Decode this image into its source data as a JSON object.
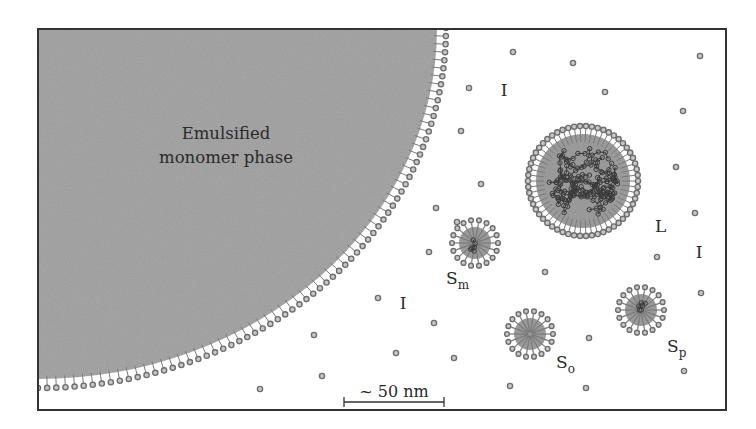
{
  "figure": {
    "width": 756,
    "height": 429,
    "frame": {
      "x": 38,
      "y": 29,
      "w": 688,
      "h": 381,
      "stroke": "#333333"
    },
    "colors": {
      "phase_fill": "#a9a9a9",
      "particle_fill": "#a0a0a0",
      "head_stroke": "#6e6e6e",
      "head_fill": "#c8c8c8",
      "tail_stroke": "#7a7a7a",
      "chain_stroke": "#3a3a3a",
      "text": "#2a2a2a"
    }
  },
  "monomer_phase": {
    "label_line1": "Emulsified",
    "label_line2": "monomer phase",
    "center": [
      38,
      28
    ],
    "rx": 408,
    "ry": 360
  },
  "particles": [
    {
      "id": "L",
      "label": "L",
      "subscript": "",
      "description": "Latex particle",
      "cx": 583,
      "cy": 181,
      "r": 47,
      "heads": 58,
      "has_chains": true,
      "chain_density": "high",
      "label_pos": [
        655,
        232
      ]
    },
    {
      "id": "Sm",
      "label": "S",
      "subscript": "m",
      "description": "Monomer-swollen micelle",
      "cx": 475,
      "cy": 243,
      "r": 16,
      "heads": 18,
      "has_chains": true,
      "chain_density": "low",
      "label_pos": [
        446,
        284
      ]
    },
    {
      "id": "So",
      "label": "S",
      "subscript": "o",
      "description": "Empty micelle",
      "cx": 530,
      "cy": 334,
      "r": 16,
      "heads": 18,
      "has_chains": false,
      "chain_density": "none",
      "label_pos": [
        556,
        368
      ]
    },
    {
      "id": "Sp",
      "label": "S",
      "subscript": "p",
      "description": "Micelle containing polymer",
      "cx": 641,
      "cy": 310,
      "r": 16,
      "heads": 18,
      "has_chains": true,
      "chain_density": "low",
      "label_pos": [
        667,
        352
      ]
    }
  ],
  "initiator_labels": [
    {
      "text": "I",
      "x": 504,
      "y": 96
    },
    {
      "text": "I",
      "x": 403,
      "y": 309
    },
    {
      "text": "I",
      "x": 699,
      "y": 258
    }
  ],
  "free_surfactant_dots": [
    [
      513,
      52
    ],
    [
      573,
      63
    ],
    [
      605,
      92
    ],
    [
      700,
      56
    ],
    [
      469,
      88
    ],
    [
      461,
      131
    ],
    [
      683,
      111
    ],
    [
      481,
      184
    ],
    [
      436,
      208
    ],
    [
      457,
      222
    ],
    [
      676,
      167
    ],
    [
      695,
      213
    ],
    [
      429,
      252
    ],
    [
      545,
      272
    ],
    [
      657,
      257
    ],
    [
      701,
      293
    ],
    [
      378,
      298
    ],
    [
      434,
      323
    ],
    [
      589,
      338
    ],
    [
      454,
      358
    ],
    [
      314,
      335
    ],
    [
      396,
      353
    ],
    [
      322,
      376
    ],
    [
      510,
      386
    ],
    [
      586,
      388
    ],
    [
      684,
      371
    ],
    [
      260,
      389
    ]
  ],
  "scale_bar": {
    "label": "~ 50 nm",
    "x1": 344,
    "x2": 444,
    "y": 402
  }
}
